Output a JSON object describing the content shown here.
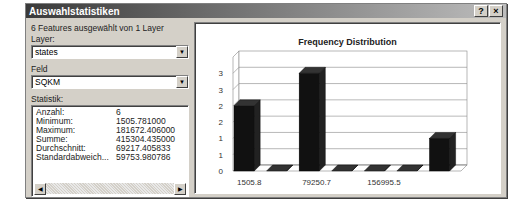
{
  "dialog": {
    "title": "Auswahlstatistiken",
    "help_btn": "?",
    "close_btn": "×"
  },
  "left": {
    "summary": "6 Features ausgewählt von 1 Layer",
    "layer_label": "Layer:",
    "layer_value": "states",
    "field_label": "Feld",
    "field_value": "SQKM",
    "stats_label": "Statistik:",
    "stats": [
      {
        "k": "Anzahl:",
        "v": "6"
      },
      {
        "k": "Minimum:",
        "v": "1505.781000"
      },
      {
        "k": "Maximum:",
        "v": "181672.406000"
      },
      {
        "k": "Summe:",
        "v": "415304.435000"
      },
      {
        "k": "Durchschnitt:",
        "v": "69217.405833"
      },
      {
        "k": "Standardabweich...",
        "v": "59753.980786"
      }
    ]
  },
  "chart_data": {
    "type": "bar",
    "title": "Frequency Distribution",
    "categories": [
      "1505.8",
      "",
      "79250.7",
      "",
      "156995.5",
      "",
      ""
    ],
    "x_tick_labels": [
      "1505.8",
      "79250.7",
      "156995.5"
    ],
    "values": [
      2,
      0,
      3,
      0,
      0,
      0,
      1
    ],
    "y_tick_labels": [
      "0",
      "1",
      "1",
      "2",
      "2",
      "3",
      "3"
    ],
    "ylim": [
      0,
      3.5
    ],
    "grid": true,
    "style": "3d",
    "bar_color": "#111111"
  }
}
